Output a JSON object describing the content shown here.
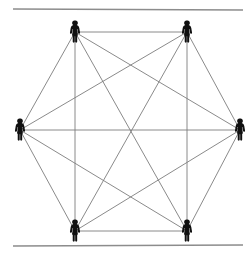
{
  "figure": {
    "type": "node-link-diagram",
    "title": "",
    "background_color": "#ffffff"
  },
  "rules": {
    "line_color": "#8c8c8c",
    "items": [
      {
        "name": "top-rule",
        "x1": 13,
        "y1": 9,
        "x2": 243,
        "y2": 10,
        "width": 1.4
      },
      {
        "name": "bottom-rule",
        "x1": 13,
        "y1": 246,
        "x2": 243,
        "y2": 245,
        "width": 1.4
      }
    ]
  },
  "graph": {
    "description": "Six human figures arranged on a hexagon, every pair joined by a line (complete graph on 6 nodes).",
    "node_count": 6,
    "edge_count": 15,
    "edge_color": "#7d7d7d",
    "edge_width": 0.9,
    "node_color": "#101010",
    "nodes": [
      {
        "id": "top-left",
        "label": "person-top-left",
        "x": 75,
        "y": 32
      },
      {
        "id": "top-right",
        "label": "person-top-right",
        "x": 187,
        "y": 32
      },
      {
        "id": "right",
        "label": "person-right",
        "x": 240,
        "y": 130
      },
      {
        "id": "bottom-right",
        "label": "person-bottom-right",
        "x": 187,
        "y": 231
      },
      {
        "id": "bottom-left",
        "label": "person-bottom-left",
        "x": 75,
        "y": 231
      },
      {
        "id": "left",
        "label": "person-left",
        "x": 20,
        "y": 130
      }
    ],
    "edges": [
      {
        "from": "top-left",
        "to": "top-right"
      },
      {
        "from": "top-left",
        "to": "right"
      },
      {
        "from": "top-left",
        "to": "bottom-right"
      },
      {
        "from": "top-left",
        "to": "bottom-left"
      },
      {
        "from": "top-left",
        "to": "left"
      },
      {
        "from": "top-right",
        "to": "right"
      },
      {
        "from": "top-right",
        "to": "bottom-right"
      },
      {
        "from": "top-right",
        "to": "bottom-left"
      },
      {
        "from": "top-right",
        "to": "left"
      },
      {
        "from": "right",
        "to": "bottom-right"
      },
      {
        "from": "right",
        "to": "bottom-left"
      },
      {
        "from": "right",
        "to": "left"
      },
      {
        "from": "bottom-right",
        "to": "bottom-left"
      },
      {
        "from": "bottom-right",
        "to": "left"
      },
      {
        "from": "bottom-left",
        "to": "left"
      }
    ]
  }
}
